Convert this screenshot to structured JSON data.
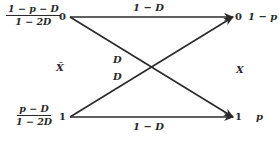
{
  "diagram": {
    "type": "binary-test-channel",
    "input_label": "X̂",
    "output_label": "X",
    "input_nodes": [
      {
        "symbol": "0",
        "prob_num": "1 − p − D",
        "prob_den": "1 − 2D"
      },
      {
        "symbol": "1",
        "prob_num": "p − D",
        "prob_den": "1 − 2D"
      }
    ],
    "output_nodes": [
      {
        "symbol": "0",
        "prob": "1 − p"
      },
      {
        "symbol": "1",
        "prob": "p"
      }
    ],
    "edges": [
      {
        "from": "0",
        "to": "0",
        "label": "1 − D"
      },
      {
        "from": "0",
        "to": "1",
        "label": "D"
      },
      {
        "from": "1",
        "to": "0",
        "label": "D"
      },
      {
        "from": "1",
        "to": "1",
        "label": "1 − D"
      }
    ],
    "colors": {
      "ink": "#2a2a2a",
      "background": "#ffffff"
    }
  }
}
